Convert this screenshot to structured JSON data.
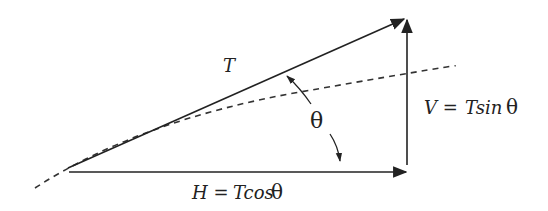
{
  "diagram": {
    "type": "force-vector-decomposition",
    "labels": {
      "tension": "T",
      "angle": "θ",
      "vertical_lhs": "V =",
      "vertical_rhs_T": "Tsin",
      "vertical_theta": "θ",
      "horizontal_lhs": "H =",
      "horizontal_rhs_T": "Tcos",
      "horizontal_theta": "θ"
    },
    "elements": [
      {
        "name": "tension-vector",
        "style": "solid-arrow",
        "from": [
          68,
          168
        ],
        "to": [
          406,
          18
        ]
      },
      {
        "name": "horizontal-component",
        "style": "solid-arrow",
        "from": [
          68,
          172
        ],
        "to": [
          406,
          172
        ]
      },
      {
        "name": "vertical-component",
        "style": "solid-arrow",
        "from": [
          407,
          165
        ],
        "to": [
          407,
          20
        ]
      },
      {
        "name": "cable-curve",
        "style": "dashed-curve"
      },
      {
        "name": "angle-indicator",
        "style": "double-arrow"
      }
    ],
    "colors": {
      "stroke": "#222222",
      "background": "#ffffff"
    }
  }
}
